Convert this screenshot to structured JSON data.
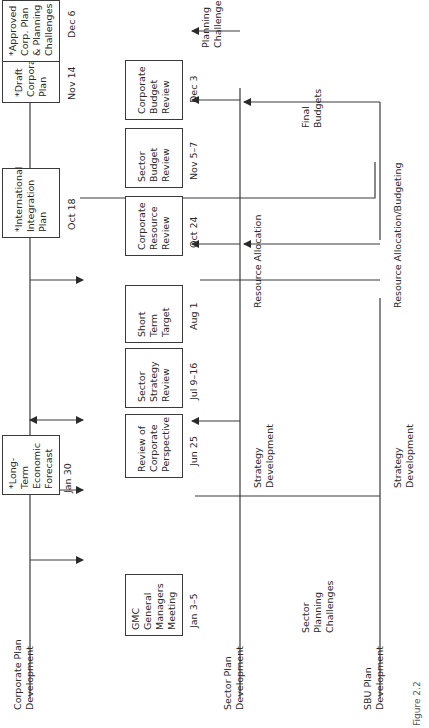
{
  "orientation": "rotated 90 degrees counter-clockwise",
  "lanes": [
    {
      "line1": "Corporate Plan",
      "line2": "Development"
    },
    {
      "line1": "Sector Plan",
      "line2": "Development"
    },
    {
      "line1": "SBU Plan",
      "line2": "Development"
    }
  ],
  "corporate_boxes": [
    {
      "lines": [
        "*Long-",
        "Term",
        "Economic",
        "Forecast"
      ],
      "date": "Jan 30"
    },
    {
      "lines": [
        "*International",
        "Integration",
        "Plan"
      ],
      "date": "Oct 18"
    },
    {
      "lines": [
        "*Draft",
        "Corporate",
        "Plan"
      ],
      "date": "Nov 14"
    },
    {
      "lines": [
        "*Approved",
        "Corp. Plan",
        "& Planning",
        "Challenges"
      ],
      "date": "Dec 6"
    }
  ],
  "sector_boxes": [
    {
      "lines": [
        "GMC",
        "General",
        "Managers",
        "Meeting"
      ],
      "date": "Jan 3–5"
    },
    {
      "lines": [
        "Review of",
        "Corporate",
        "Perspective"
      ],
      "date": "Jun 25"
    },
    {
      "lines": [
        "Sector",
        "Strategy",
        "Review"
      ],
      "date": "Jul 9–16"
    },
    {
      "lines": [
        "Short",
        "Term",
        "Target"
      ],
      "date": "Aug 1"
    },
    {
      "lines": [
        "Corporate",
        "Resource",
        "Review"
      ],
      "date": "Oct 24"
    },
    {
      "lines": [
        "Sector",
        "Budget",
        "Review"
      ],
      "date": "Nov 5–7"
    },
    {
      "lines": [
        "Corporate",
        "Budget",
        "Review"
      ],
      "date": "Dec 3"
    }
  ],
  "flow_labels": {
    "strategy_dev_1": [
      "Strategy",
      "Development"
    ],
    "strategy_dev_2": [
      "Strategy",
      "Development"
    ],
    "sector_planning_challenges": [
      "Sector",
      "Planning",
      "Challenges"
    ],
    "resource_allocation": "Resource Allocation",
    "resource_allocation_budgeting": "Resource Allocation/Budgeting",
    "planning_challenges": [
      "Planning",
      "Challenges"
    ],
    "final_budgets": [
      "Final",
      "Budgets"
    ]
  },
  "caption": "Figure 2.2",
  "colors": {
    "line": "#3a3a3a",
    "text": "#2a2a2a",
    "background": "#ffffff"
  }
}
